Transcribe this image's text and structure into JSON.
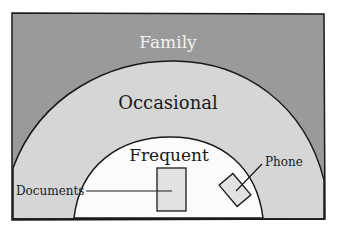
{
  "diagram": {
    "type": "nested-zones",
    "zones": [
      {
        "id": "family",
        "label": "Family",
        "fill": "#9a9a9a",
        "text_color": "#f2f2f2"
      },
      {
        "id": "occasional",
        "label": "Occasional",
        "fill": "#d6d6d6",
        "text_color": "#1a1a1a"
      },
      {
        "id": "frequent",
        "label": "Frequent",
        "fill": "#fbfbfb",
        "text_color": "#1a1a1a"
      }
    ],
    "items": [
      {
        "id": "documents",
        "label": "Documents",
        "zone": "frequent"
      },
      {
        "id": "phone",
        "label": "Phone",
        "zone": "frequent"
      }
    ],
    "colors": {
      "outline": "#1a1a1a",
      "background": "#ffffff"
    }
  }
}
